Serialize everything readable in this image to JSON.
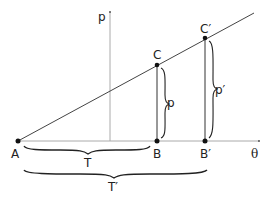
{
  "figure": {
    "axes": {
      "vertical_label": "p",
      "horizontal_label": "θ"
    },
    "points": {
      "A": "A",
      "B": "B",
      "B_prime": "B′",
      "C": "C",
      "C_prime": "C′"
    },
    "segment_labels": {
      "p": "p",
      "p_prime": "p′",
      "T": "T",
      "T_prime": "T′"
    },
    "colors": {
      "axis": "#aaaaaa",
      "line": "#444444",
      "point": "#111111"
    }
  }
}
